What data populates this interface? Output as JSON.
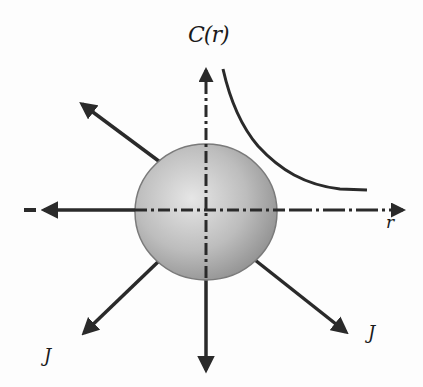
{
  "diagram": {
    "type": "radial-diffusion-schematic",
    "labels": {
      "concentration": "C(r)",
      "radial_axis": "r",
      "flux_left": "J",
      "flux_right": "J"
    },
    "colors": {
      "stroke": "#2a2a2a",
      "sphere_light": "#e2e2e2",
      "sphere_dark": "#8e8e8e",
      "background": "#fdfdfd"
    },
    "elements": [
      "sphere",
      "horizontal-dash-dot-axis",
      "vertical-dash-dot-axis",
      "decay-curve",
      "flux-arrow-up-left",
      "flux-arrow-down-left",
      "flux-arrow-down",
      "flux-arrow-down-right"
    ]
  }
}
